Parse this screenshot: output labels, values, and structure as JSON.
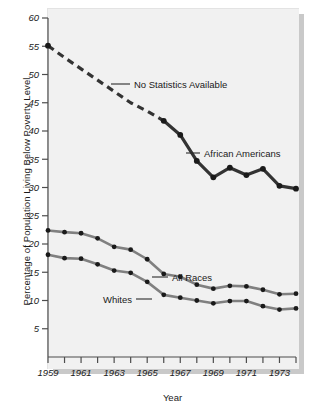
{
  "chart_data": {
    "type": "line",
    "title": "",
    "xlabel": "Year",
    "ylabel": "Percentage of Population Living Below Poverty Level",
    "xlim": [
      1959,
      1974
    ],
    "ylim": [
      0,
      60
    ],
    "yticks": [
      5,
      10,
      15,
      20,
      25,
      30,
      35,
      40,
      45,
      50,
      55,
      60
    ],
    "ytick_labels": [
      "5",
      "10",
      "15",
      "20",
      "25",
      "30",
      "35",
      "40",
      "45",
      "50",
      "55",
      "60"
    ],
    "xticks": [
      1959,
      1960,
      1961,
      1962,
      1963,
      1964,
      1965,
      1966,
      1967,
      1968,
      1969,
      1970,
      1971,
      1972,
      1973,
      1974
    ],
    "xtick_labels": [
      "1959",
      "",
      "1961",
      "",
      "1963",
      "",
      "1965",
      "",
      "1967",
      "",
      "1969",
      "",
      "1971",
      "",
      "1973",
      ""
    ],
    "grid": false,
    "legend_position": "inline-annotations",
    "x": [
      1959,
      1960,
      1961,
      1962,
      1963,
      1964,
      1965,
      1966,
      1967,
      1968,
      1969,
      1970,
      1971,
      1972,
      1973,
      1974
    ],
    "series": [
      {
        "name": "African Americans",
        "color": "#333333",
        "style": "dashed-then-solid",
        "dashed_through": 1966,
        "markers_on": [
          1959,
          1966,
          1967,
          1968,
          1969,
          1970,
          1971,
          1972,
          1973,
          1974
        ],
        "values": [
          55.1,
          53.0,
          51.0,
          49.0,
          47.0,
          45.0,
          43.5,
          41.8,
          39.3,
          34.7,
          31.8,
          33.5,
          32.2,
          33.3,
          30.3,
          29.8
        ]
      },
      {
        "name": "All Races",
        "color": "#808080",
        "style": "solid",
        "values": [
          22.4,
          22.1,
          21.9,
          21.0,
          19.5,
          19.0,
          17.3,
          14.7,
          14.2,
          12.8,
          12.1,
          12.6,
          12.5,
          11.9,
          11.1,
          11.2
        ]
      },
      {
        "name": "Whites",
        "color": "#808080",
        "style": "solid",
        "values": [
          18.1,
          17.5,
          17.4,
          16.4,
          15.3,
          14.9,
          13.3,
          11.0,
          10.5,
          10.0,
          9.5,
          9.9,
          9.9,
          9.0,
          8.4,
          8.6
        ]
      }
    ],
    "annotations": [
      {
        "text": "No Statistics Available",
        "target_series": "African Americans"
      },
      {
        "text": "African Americans",
        "target_series": "African Americans"
      },
      {
        "text": "All Races",
        "target_series": "All Races"
      },
      {
        "text": "Whites",
        "target_series": "Whites"
      }
    ]
  },
  "axis": {
    "y_title": "Percentage of Population Living Below Poverty Level",
    "x_title": "Year"
  },
  "colors": {
    "plate_bg": "#f1f1f1",
    "shadow": "#c9c9c9",
    "axis": "#4d4d4d",
    "dark_series": "#333333",
    "gray_series": "#808080",
    "marker": "#1a1a1a",
    "text": "#1a1a1a"
  }
}
